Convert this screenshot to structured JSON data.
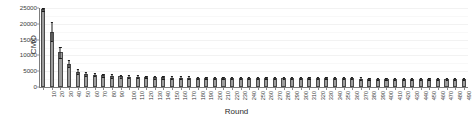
{
  "chart_data": {
    "type": "bar",
    "title": "",
    "subtitle": "",
    "xlabel": "Round",
    "ylabel": "CMO",
    "xlim": [
      0,
      51
    ],
    "ylim": [
      0,
      25000
    ],
    "grid": true,
    "legend": null,
    "y_ticks": [
      0,
      5000,
      10000,
      15000,
      20000,
      25000
    ],
    "y_tick_labels": [
      "0",
      "5000",
      "10000",
      "15000",
      "20000",
      "25000"
    ],
    "categories": [
      "10",
      "20",
      "30",
      "40",
      "50",
      "60",
      "70",
      "80",
      "90",
      "100",
      "110",
      "120",
      "130",
      "140",
      "150",
      "160",
      "170",
      "180",
      "190",
      "200",
      "210",
      "220",
      "230",
      "240",
      "250",
      "260",
      "270",
      "280",
      "290",
      "300",
      "310",
      "320",
      "330",
      "340",
      "350",
      "360",
      "370",
      "380",
      "390",
      "400",
      "410",
      "420",
      "430",
      "440",
      "450",
      "460",
      "470",
      "480",
      "490",
      "500"
    ],
    "values": [
      24800,
      17500,
      11000,
      7400,
      4800,
      4100,
      3900,
      3700,
      3500,
      3400,
      3300,
      3200,
      3150,
      3100,
      3050,
      3000,
      2980,
      2950,
      2930,
      2900,
      2880,
      2870,
      2850,
      2840,
      2820,
      2800,
      2790,
      2780,
      2770,
      2760,
      2750,
      2740,
      2730,
      2720,
      2710,
      2700,
      2700,
      2690,
      2680,
      2680,
      2670,
      2660,
      2660,
      2650,
      2650,
      2640,
      2630,
      2630,
      2620,
      2620
    ],
    "errors": [
      900,
      3000,
      1700,
      1100,
      800,
      600,
      550,
      520,
      500,
      480,
      460,
      450,
      440,
      430,
      420,
      410,
      400,
      400,
      390,
      390,
      380,
      380,
      370,
      370,
      360,
      360,
      355,
      350,
      350,
      345,
      340,
      340,
      335,
      330,
      330,
      325,
      320,
      320,
      315,
      315,
      310,
      310,
      305,
      300,
      300,
      300,
      295,
      295,
      290,
      290
    ],
    "error_type": "symmetric",
    "bar_color": "#9d9d9d",
    "bar_edge_color": "#4a4a4a",
    "error_color": "#1a1a1a",
    "grid_color": "#f2f2f2",
    "axis_color": "#7d7d7d",
    "background_color": "#ffffff"
  }
}
